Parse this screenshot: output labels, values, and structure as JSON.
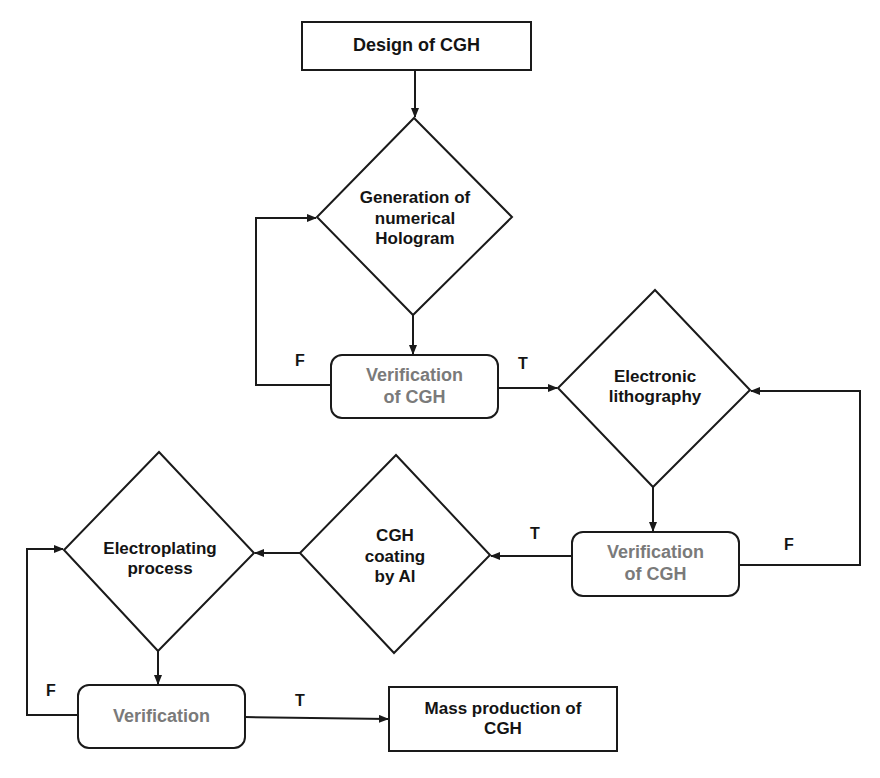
{
  "diagram": {
    "type": "flowchart",
    "colors": {
      "stroke": "#1a1a1a",
      "text_dark": "#141414",
      "text_verification": "#7a7a7a",
      "background": "#ffffff"
    },
    "nodes": {
      "design": {
        "label": "Design of CGH",
        "shape": "rectangle"
      },
      "generation": {
        "label": "Generation of numerical Hologram",
        "lines": [
          "Generation of",
          "numerical",
          "Hologram"
        ],
        "shape": "diamond"
      },
      "verification1": {
        "label": "Verification of CGH",
        "lines": [
          "Verification",
          "of CGH"
        ],
        "shape": "rounded-rectangle"
      },
      "lithography": {
        "label": "Electronic lithography",
        "lines": [
          "Electronic",
          "lithography"
        ],
        "shape": "diamond"
      },
      "verification2": {
        "label": "Verification of CGH",
        "lines": [
          "Verification",
          "of CGH"
        ],
        "shape": "rounded-rectangle"
      },
      "coating": {
        "label": "CGH coating by Al",
        "lines": [
          "CGH",
          "coating",
          "by Al"
        ],
        "shape": "diamond"
      },
      "electroplating": {
        "label": "Electroplating process",
        "lines": [
          "Electroplating",
          "process"
        ],
        "shape": "diamond"
      },
      "verification3": {
        "label": "Verification",
        "shape": "rounded-rectangle"
      },
      "mass": {
        "label": "Mass production of CGH",
        "lines": [
          "Mass production of",
          "CGH"
        ],
        "shape": "rectangle"
      }
    },
    "edge_labels": {
      "v1_false": "F",
      "v1_true": "T",
      "v2_true": "T",
      "v2_false": "F",
      "v3_false": "F",
      "v3_true": "T"
    },
    "edges": [
      {
        "from": "design",
        "to": "generation"
      },
      {
        "from": "generation",
        "to": "verification1"
      },
      {
        "from": "verification1",
        "to": "generation",
        "label": "F"
      },
      {
        "from": "verification1",
        "to": "lithography",
        "label": "T"
      },
      {
        "from": "lithography",
        "to": "verification2"
      },
      {
        "from": "verification2",
        "to": "lithography",
        "label": "F"
      },
      {
        "from": "verification2",
        "to": "coating",
        "label": "T"
      },
      {
        "from": "coating",
        "to": "electroplating"
      },
      {
        "from": "electroplating",
        "to": "verification3"
      },
      {
        "from": "verification3",
        "to": "electroplating",
        "label": "F"
      },
      {
        "from": "verification3",
        "to": "mass",
        "label": "T"
      }
    ]
  }
}
